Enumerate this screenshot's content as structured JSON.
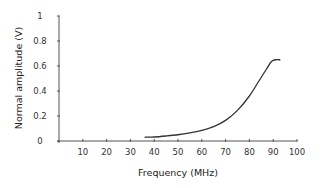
{
  "chart_data": {
    "type": "line",
    "title": "",
    "xlabel": "Frequency (MHz)",
    "ylabel": "Normal amplitude (V)",
    "xlim": [
      0,
      100
    ],
    "ylim": [
      0,
      1
    ],
    "grid": false,
    "legend": null,
    "x_ticks": [
      10,
      20,
      30,
      40,
      50,
      60,
      70,
      80,
      90,
      100
    ],
    "y_ticks": [
      0,
      0.2,
      0.4,
      0.6,
      0.8,
      1
    ],
    "y_tick_labels": [
      "0",
      "0.2",
      "0.4",
      "0.6",
      "0.8",
      "1"
    ],
    "x_tick_labels": [
      "10",
      "20",
      "30",
      "40",
      "50",
      "60",
      "70",
      "80",
      "90",
      "100"
    ],
    "series": [
      {
        "name": "Normal amplitude",
        "x": [
          36,
          40,
          45,
          50,
          55,
          60,
          65,
          70,
          75,
          80,
          84,
          87,
          89,
          90,
          91,
          93
        ],
        "y": [
          0.03,
          0.032,
          0.04,
          0.05,
          0.065,
          0.085,
          0.115,
          0.165,
          0.245,
          0.36,
          0.48,
          0.57,
          0.63,
          0.645,
          0.65,
          0.65
        ]
      }
    ]
  }
}
